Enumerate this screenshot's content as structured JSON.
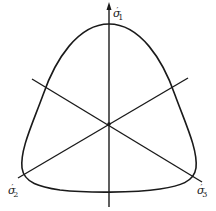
{
  "diagram": {
    "title": "",
    "colors": {
      "stroke": "#1a1a1a",
      "background": "#ffffff"
    },
    "axes": [
      {
        "id": "sigma1",
        "symbol": "σ",
        "subscript": "1",
        "prime": "′",
        "direction": "up"
      },
      {
        "id": "sigma2",
        "symbol": "σ",
        "subscript": "2",
        "prime": "′",
        "direction": "lower-left"
      },
      {
        "id": "sigma3",
        "symbol": "σ",
        "subscript": "3",
        "prime": "′",
        "direction": "lower-right"
      }
    ],
    "curve": {
      "shape": "rounded-triangle yield locus",
      "closed": true
    }
  }
}
